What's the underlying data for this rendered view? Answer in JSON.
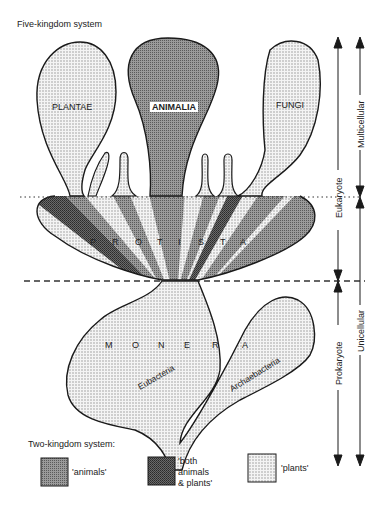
{
  "title": "Five-kingdom system",
  "kingdoms": {
    "plantae": "PLANTAE",
    "animalia": "ANIMALIA",
    "fungi": "FUNGI",
    "protista": [
      "P",
      "R",
      "O",
      "T",
      "I",
      "S",
      "T",
      "A"
    ],
    "monera": [
      "M",
      "O",
      "N",
      "E",
      "R",
      "A"
    ],
    "eubacteria": "Eubacteria",
    "archaebacteria": "Archaebacteria"
  },
  "axes": {
    "eukaryote": "Eukaryote",
    "prokaryote": "Prokaryote",
    "multicellular": "Multicellular",
    "unicellular": "Unicellular"
  },
  "legend": {
    "title": "Two-kingdom system:",
    "items": [
      {
        "label": "'animals'",
        "pattern": "medium-dark dotted"
      },
      {
        "label": "'both animals & plants'",
        "line1": "'both",
        "line2": "animals",
        "line3": "& plants'",
        "pattern": "dark cross-hatch"
      },
      {
        "label": "'plants'",
        "pattern": "light stipple"
      }
    ]
  },
  "colors": {
    "outline": "#1a1a1a",
    "plants_fill": "#d9d9d9",
    "animals_fill": "#8a8a8a",
    "both_fill": "#5a5a5a"
  }
}
